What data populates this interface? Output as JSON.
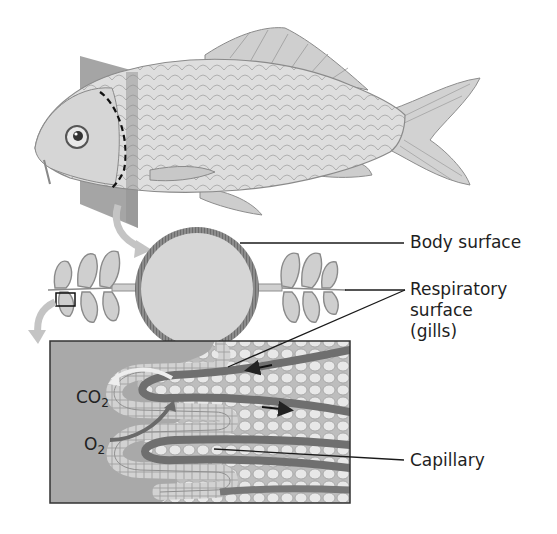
{
  "diagram": {
    "labels": {
      "body_surface": "Body surface",
      "respiratory_surface_line1": "Respiratory",
      "respiratory_surface_line2": "surface",
      "respiratory_surface_line3": "(gills)",
      "capillary": "Capillary"
    },
    "gas_labels": {
      "co2_base": "CO",
      "co2_sub": "2",
      "o2_base": "O",
      "o2_sub": "2"
    },
    "colors": {
      "panel_fill": "#a9a9a9",
      "panel_border": "#333333",
      "body_circle_fill": "#d6d6d6",
      "body_circle_ring": "#8a8a8a",
      "gill_fill": "#cfcfcf",
      "capillary": "#6f6f6f",
      "arrow_light": "#c4c4c4",
      "fish_body": "#d9d9d9",
      "section_plane": "#9a9a9a"
    }
  }
}
